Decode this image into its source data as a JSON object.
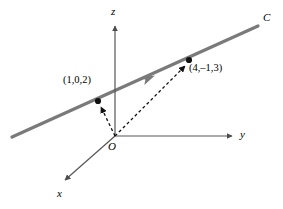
{
  "figure": {
    "name": "3d-line-diagram",
    "background": "#ffffff",
    "axes": {
      "z": {
        "label": "z",
        "from": [
          115,
          136
        ],
        "to": [
          115,
          22
        ],
        "arrow": true,
        "color": "#555555"
      },
      "y": {
        "label": "y",
        "from": [
          115,
          136
        ],
        "to": [
          236,
          136
        ],
        "arrow": true,
        "color": "#555555"
      },
      "x": {
        "label": "x",
        "from": [
          115,
          136
        ],
        "to": [
          62,
          182
        ],
        "arrow": true,
        "color": "#555555"
      },
      "origin_label": "O"
    },
    "line": {
      "label": "C",
      "color": "#7a7a7a",
      "width": 3,
      "from": [
        12,
        137
      ],
      "to": [
        258,
        26
      ],
      "direction_arrow_at": [
        149,
        79
      ],
      "direction_arrow_label": "direction-arrow"
    },
    "points": [
      {
        "label": "(1,0,2)",
        "x": 98,
        "y": 101,
        "label_x": 63,
        "label_y": 75,
        "vector_from": [
          115,
          136
        ],
        "color": "#000000"
      },
      {
        "label": "(4,–1,3)",
        "x": 189,
        "y": 60,
        "label_x": 189,
        "label_y": 63,
        "vector_from": [
          115,
          136
        ],
        "color": "#000000"
      }
    ],
    "vectors": {
      "style": "dashed",
      "color": "#000000",
      "dash": "3,2.5",
      "width": 1.3
    }
  }
}
